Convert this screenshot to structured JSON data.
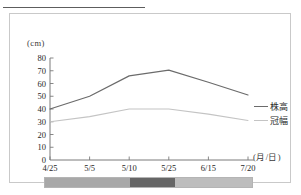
{
  "chart_data": {
    "type": "line",
    "title": "",
    "xlabel": "(月/日)",
    "ylabel": "(cm)",
    "categories": [
      "4/25",
      "5/5",
      "5/10",
      "5/25",
      "6/15",
      "7/20"
    ],
    "ylim": [
      0,
      80
    ],
    "yticks": [
      80,
      70,
      60,
      50,
      40,
      30,
      20,
      10,
      0
    ],
    "grid": false,
    "legend_position": "right",
    "series": [
      {
        "name": "株高",
        "color": "#6b6b6b",
        "values": [
          40,
          50,
          66,
          70.5,
          61,
          51
        ]
      },
      {
        "name": "冠幅",
        "color": "#c4c4c4",
        "values": [
          30,
          34,
          40,
          40,
          36,
          31
        ]
      }
    ],
    "colorbar": {
      "segments": [
        {
          "name": "segment-light-left",
          "color": "#a8a8a8",
          "width_pct": 41
        },
        {
          "name": "segment-dark-middle",
          "color": "#666666",
          "width_pct": 22
        },
        {
          "name": "segment-light-right",
          "color": "#bdbdbd",
          "width_pct": 37
        }
      ]
    }
  },
  "axis": {
    "y_unit_label": "(cm)",
    "x_unit_label": "(月/日)"
  },
  "colors": {
    "series_primary": "#6b6b6b",
    "series_secondary": "#c4c4c4",
    "axis": "#7a7a7a",
    "panel_border": "#c9c9c9",
    "top_rule": "#5d5d5d"
  }
}
